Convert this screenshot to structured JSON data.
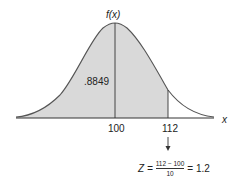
{
  "diagram": {
    "type": "normal-distribution",
    "y_axis_label": "f(x)",
    "x_axis_label": "x",
    "shaded_area_label": ".8849",
    "mean_tick_label": "100",
    "value_tick_label": "112",
    "mean": 100,
    "std_dev": 10,
    "value": 112,
    "shaded_probability": 0.8849,
    "colors": {
      "shade": "#d9d9d9",
      "curve": "#555555",
      "axis": "#333333"
    }
  },
  "formula": {
    "lhs": "Z =",
    "numerator": "112 − 100",
    "denominator": "10",
    "result": "= 1.2"
  }
}
